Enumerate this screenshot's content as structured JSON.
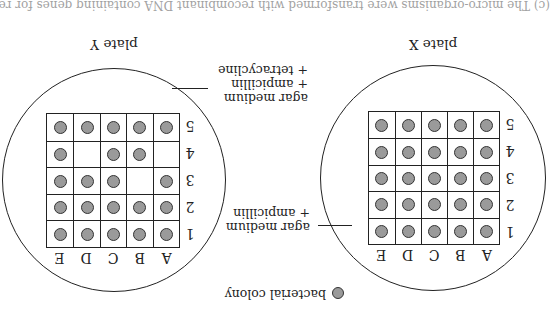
{
  "figure": {
    "orientation": "rotated-180",
    "cutoff_text": "(c) The micro-organisms were transformed with recombinant DNA containing genes for resistance ...",
    "legend": {
      "icon": "colony-circle-icon",
      "label": "bacterial colony"
    },
    "colors": {
      "colony_fill": "#9a9a9a",
      "outline": "#222222"
    },
    "column_labels": [
      "A",
      "B",
      "C",
      "D",
      "E"
    ],
    "row_labels": [
      "1",
      "2",
      "3",
      "4",
      "5"
    ],
    "plates": [
      {
        "id": "X",
        "label": "plate X",
        "medium": [
          "agar medium",
          "+ ampicillin"
        ],
        "grid": [
          [
            1,
            1,
            1,
            1,
            1
          ],
          [
            1,
            1,
            1,
            1,
            1
          ],
          [
            1,
            1,
            1,
            1,
            1
          ],
          [
            1,
            1,
            1,
            1,
            1
          ],
          [
            1,
            1,
            1,
            1,
            1
          ]
        ]
      },
      {
        "id": "Y",
        "label": "plate Y",
        "medium": [
          "agar medium",
          "+ ampicillin",
          "+ tetracycline"
        ],
        "grid": [
          [
            1,
            1,
            1,
            1,
            1
          ],
          [
            1,
            1,
            1,
            1,
            1
          ],
          [
            1,
            0,
            1,
            1,
            1
          ],
          [
            0,
            1,
            1,
            0,
            1
          ],
          [
            1,
            1,
            1,
            1,
            1
          ]
        ]
      }
    ]
  }
}
